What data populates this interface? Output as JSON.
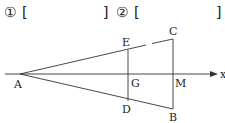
{
  "header": {
    "blank1": {
      "marker": "①",
      "open": "[",
      "close": "]"
    },
    "blank2": {
      "marker": "②",
      "open": "[",
      "close": "]"
    }
  },
  "diagram": {
    "axis_label": "x",
    "points": {
      "A": "A",
      "B": "B",
      "C": "C",
      "D": "D",
      "E": "E",
      "G": "G",
      "M": "M"
    },
    "colors": {
      "line": "#333333",
      "text": "#222222",
      "background": "#ffffff"
    }
  }
}
